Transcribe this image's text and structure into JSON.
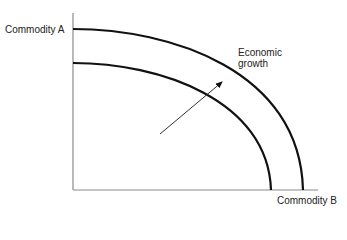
{
  "diagram": {
    "y_axis_label": "Commodity A",
    "x_axis_label": "Commodity B",
    "annotation": {
      "line1": "Economic",
      "line2": "growth"
    },
    "curves": [
      {
        "name": "original-ppf",
        "y_intercept_px": 63,
        "x_intercept_px": 271
      },
      {
        "name": "shifted-ppf",
        "y_intercept_px": 29,
        "x_intercept_px": 303
      }
    ],
    "arrow": {
      "from": [
        160,
        134
      ],
      "to": [
        222,
        82
      ]
    },
    "colors": {
      "curve": "#111111",
      "axis": "#888888",
      "text": "#222222"
    }
  }
}
